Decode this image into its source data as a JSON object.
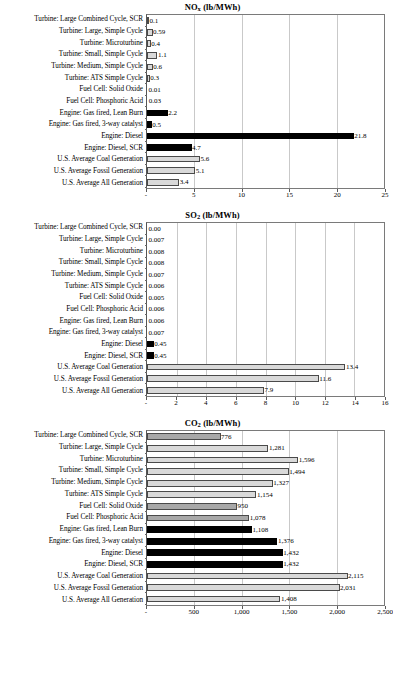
{
  "figure": {
    "bar_styles": {
      "light": "#d9d9d9",
      "mid": "#a8a8a8",
      "dark": "#000000"
    }
  },
  "categories": [
    "Turbine: Large Combined Cycle, SCR",
    "Turbine: Large, Simple Cycle",
    "Turbine: Microturbine",
    "Turbine: Small, Simple Cycle",
    "Turbine: Medium, Simple Cycle",
    "Turbine: ATS Simple Cycle",
    "Fuel Cell: Solid Oxide",
    "Fuel Cell: Phosphoric Acid",
    "Engine: Gas fired, Lean Burn",
    "Engine: Gas fired, 3-way catalyst",
    "Engine: Diesel",
    "Engine: Diesel, SCR",
    "U.S. Average Coal Generation",
    "U.S. Average Fossil Generation",
    "U.S. Average All Generation"
  ],
  "chart_data": [
    {
      "type": "bar",
      "orientation": "horizontal",
      "id": "nox",
      "title_main": "NO",
      "title_sub": "x",
      "title_unit": " (lb/MWh)",
      "title": "NOx (lb/MWh)",
      "xlabel": "",
      "ylabel": "",
      "xlim": [
        0,
        25
      ],
      "ticks": [
        0,
        5,
        10,
        15,
        20,
        25
      ],
      "tick_labels": [
        "-",
        "5",
        "10",
        "15",
        "20",
        "25"
      ],
      "grid": true,
      "categories": [
        "Turbine: Large Combined Cycle, SCR",
        "Turbine: Large, Simple Cycle",
        "Turbine: Microturbine",
        "Turbine: Small, Simple Cycle",
        "Turbine: Medium, Simple Cycle",
        "Turbine: ATS Simple Cycle",
        "Fuel Cell: Solid Oxide",
        "Fuel Cell: Phosphoric Acid",
        "Engine: Gas fired, Lean Burn",
        "Engine: Gas fired, 3-way catalyst",
        "Engine: Diesel",
        "Engine: Diesel, SCR",
        "U.S. Average Coal Generation",
        "U.S. Average Fossil Generation",
        "U.S. Average All Generation"
      ],
      "values": [
        0.1,
        0.59,
        0.4,
        1.1,
        0.6,
        0.3,
        0.01,
        0.03,
        2.2,
        0.5,
        21.8,
        4.7,
        5.6,
        5.1,
        3.4
      ],
      "labels": [
        "0.1",
        "0.59",
        "0.4",
        "1.1",
        "0.6",
        "0.3",
        "0.01",
        "0.03",
        "2.2",
        "0.5",
        "21.8",
        "4.7",
        "5.6",
        "5.1",
        "3.4"
      ],
      "shades": [
        "light",
        "light",
        "light",
        "light",
        "light",
        "light",
        "light",
        "light",
        "dark",
        "dark",
        "dark",
        "dark",
        "light",
        "light",
        "light"
      ]
    },
    {
      "type": "bar",
      "orientation": "horizontal",
      "id": "so2",
      "title_main": "SO",
      "title_sub": "2",
      "title_unit": " (lb/MWh)",
      "title": "SO2 (lb/MWh)",
      "xlabel": "",
      "ylabel": "",
      "xlim": [
        0,
        16
      ],
      "ticks": [
        0,
        2,
        4,
        6,
        8,
        10,
        12,
        14,
        16
      ],
      "tick_labels": [
        "-",
        "2",
        "4",
        "6",
        "8",
        "10",
        "12",
        "14",
        "16"
      ],
      "grid": true,
      "categories": [
        "Turbine: Large Combined Cycle, SCR",
        "Turbine: Large, Simple Cycle",
        "Turbine: Microturbine",
        "Turbine: Small, Simple Cycle",
        "Turbine: Medium, Simple Cycle",
        "Turbine: ATS Simple Cycle",
        "Fuel Cell: Solid Oxide",
        "Fuel Cell: Phosphoric Acid",
        "Engine: Gas fired, Lean Burn",
        "Engine: Gas fired, 3-way catalyst",
        "Engine: Diesel",
        "Engine: Diesel, SCR",
        "U.S. Average Coal Generation",
        "U.S. Average Fossil Generation",
        "U.S. Average All Generation"
      ],
      "values": [
        0.0,
        0.007,
        0.008,
        0.008,
        0.007,
        0.006,
        0.005,
        0.006,
        0.006,
        0.007,
        0.45,
        0.45,
        13.4,
        11.6,
        7.9
      ],
      "labels": [
        "0.00",
        "0.007",
        "0.008",
        "0.008",
        "0.007",
        "0.006",
        "0.005",
        "0.006",
        "0.006",
        "0.007",
        "0.45",
        "0.45",
        "13.4",
        "11.6",
        "7.9"
      ],
      "shades": [
        "light",
        "light",
        "light",
        "light",
        "light",
        "light",
        "light",
        "light",
        "dark",
        "dark",
        "dark",
        "dark",
        "light",
        "light",
        "light"
      ]
    },
    {
      "type": "bar",
      "orientation": "horizontal",
      "id": "co2",
      "title_main": "CO",
      "title_sub": "2",
      "title_unit": " (lb/MWh)",
      "title": "CO2 (lb/MWh)",
      "xlabel": "",
      "ylabel": "",
      "xlim": [
        0,
        2500
      ],
      "ticks": [
        0,
        500,
        1000,
        1500,
        2000,
        2500
      ],
      "tick_labels": [
        "-",
        "500",
        "1,000",
        "1,500",
        "2,000",
        "2,500"
      ],
      "grid": true,
      "categories": [
        "Turbine: Large Combined Cycle, SCR",
        "Turbine: Large, Simple Cycle",
        "Turbine: Microturbine",
        "Turbine: Small, Simple Cycle",
        "Turbine: Medium, Simple Cycle",
        "Turbine: ATS Simple Cycle",
        "Fuel Cell: Solid Oxide",
        "Fuel Cell: Phosphoric Acid",
        "Engine: Gas fired, Lean Burn",
        "Engine: Gas fired, 3-way catalyst",
        "Engine: Diesel",
        "Engine: Diesel, SCR",
        "U.S. Average Coal Generation",
        "U.S. Average Fossil Generation",
        "U.S. Average All Generation"
      ],
      "values": [
        776,
        1281,
        1596,
        1494,
        1327,
        1154,
        950,
        1078,
        1108,
        1376,
        1432,
        1432,
        2115,
        2031,
        1408
      ],
      "labels": [
        "776",
        "1,281",
        "1,596",
        "1,494",
        "1,327",
        "1,154",
        "950",
        "1,078",
        "1,108",
        "1,376",
        "1,432",
        "1,432",
        "2,115",
        "2,031",
        "1,408"
      ],
      "shades": [
        "mid",
        "light",
        "light",
        "light",
        "light",
        "light",
        "mid",
        "mid",
        "dark",
        "dark",
        "dark",
        "dark",
        "light",
        "light",
        "light"
      ]
    }
  ]
}
